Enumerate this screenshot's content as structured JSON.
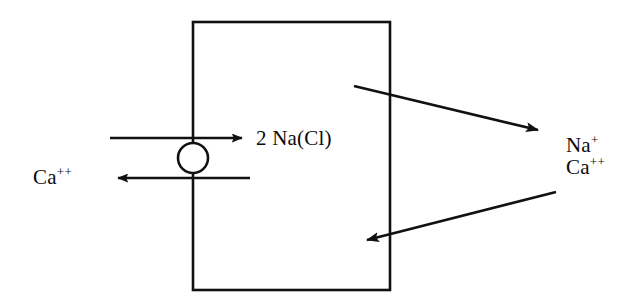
{
  "diagram": {
    "stroke_color": "#111111",
    "fill_color": "#ffffff",
    "background_color": "#ffffff",
    "cell_box": {
      "name": "cell-compartment",
      "x": 193,
      "y": 22,
      "width": 197,
      "height": 268,
      "stroke_width": 2.6
    },
    "transporter": {
      "name": "exchanger-circle",
      "cx": 193,
      "cy": 158,
      "r": 15,
      "stroke_width": 2.6
    },
    "labels": {
      "ca_out": {
        "species": "Ca",
        "charge": "++"
      },
      "na_cl_influx": "2 Na(Cl)",
      "right_na": {
        "species": "Na",
        "charge": "+"
      },
      "right_ca": {
        "species": "Ca",
        "charge": "++"
      }
    },
    "arrows": [
      {
        "name": "na-influx-arrow",
        "direction": "right",
        "x1": 110,
        "y1": 138,
        "x2": 250,
        "y2": 138,
        "label": "2 Na(Cl)"
      },
      {
        "name": "ca-efflux-arrow",
        "direction": "left",
        "x1": 250,
        "y1": 178,
        "x2": 110,
        "y2": 178,
        "label": "Ca++"
      },
      {
        "name": "outward-diagonal-arrow",
        "direction": "right-down",
        "x1": 354,
        "y1": 86,
        "x2": 547,
        "y2": 133
      },
      {
        "name": "inward-diagonal-arrow",
        "direction": "left-down",
        "x1": 556,
        "y1": 192,
        "x2": 358,
        "y2": 242
      }
    ]
  }
}
